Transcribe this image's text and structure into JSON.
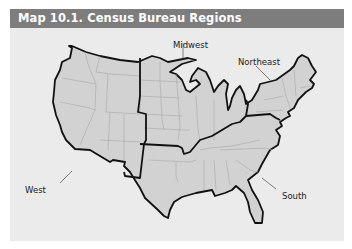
{
  "title": "Map 10.1. Census Bureau Regions",
  "regions": [
    {
      "name": "West",
      "label": "West"
    },
    {
      "name": "Midwest",
      "label": "Midwest"
    },
    {
      "name": "Northeast",
      "label": "Northeast"
    },
    {
      "name": "South",
      "label": "South"
    }
  ],
  "colors": {
    "title_bar": "#7d7d7d",
    "background": "#ebebeb",
    "land": "#d2d2d2",
    "state_border": "#a8a8a8",
    "region_border": "#111111"
  }
}
